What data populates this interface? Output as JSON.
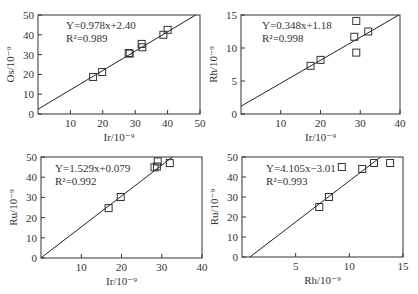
{
  "chart_data": [
    {
      "type": "scatter",
      "panel": "top-left",
      "xlabel": "Ir/10⁻⁹",
      "ylabel": "Os/10⁻⁹",
      "xlim": [
        0,
        50
      ],
      "ylim": [
        0,
        50
      ],
      "xticks": [
        10,
        20,
        30,
        40,
        50
      ],
      "yticks": [
        0,
        10,
        20,
        30,
        40,
        50
      ],
      "equation": "Y=0.978x+2.40",
      "r2": "R²=0.989",
      "fit": {
        "slope": 0.978,
        "intercept": 2.4
      },
      "points": [
        {
          "x": 17.0,
          "y": 18.7
        },
        {
          "x": 19.8,
          "y": 21.2
        },
        {
          "x": 28.0,
          "y": 30.8
        },
        {
          "x": 28.3,
          "y": 30.5
        },
        {
          "x": 32.0,
          "y": 35.4
        },
        {
          "x": 32.2,
          "y": 33.7
        },
        {
          "x": 38.7,
          "y": 40.0
        },
        {
          "x": 40.0,
          "y": 42.5
        }
      ],
      "grid": false
    },
    {
      "type": "scatter",
      "panel": "top-right",
      "xlabel": "Ir/10⁻⁹",
      "ylabel": "Rh/10⁻⁹",
      "xlim": [
        0,
        40
      ],
      "ylim": [
        0,
        15
      ],
      "xticks": [
        10,
        20,
        30,
        40
      ],
      "yticks": [
        0,
        5,
        10,
        15
      ],
      "equation": "Y=0.348x+1.18",
      "r2": "R²=0.998",
      "fit": {
        "slope": 0.348,
        "intercept": 1.18
      },
      "points": [
        {
          "x": 17.5,
          "y": 7.3
        },
        {
          "x": 20.0,
          "y": 8.2
        },
        {
          "x": 28.5,
          "y": 11.7
        },
        {
          "x": 29.0,
          "y": 14.1
        },
        {
          "x": 29.0,
          "y": 9.3
        },
        {
          "x": 32.0,
          "y": 12.5
        }
      ],
      "grid": false
    },
    {
      "type": "scatter",
      "panel": "bottom-left",
      "xlabel": "Ir/10⁻⁹",
      "ylabel": "Ru/10⁻⁹",
      "xlim": [
        0,
        40
      ],
      "ylim": [
        0,
        50
      ],
      "xticks": [
        10,
        20,
        30,
        40
      ],
      "yticks": [
        0,
        10,
        20,
        30,
        40,
        50
      ],
      "equation": "Y=1.529x+0.079",
      "r2": "R²=0.992",
      "fit": {
        "slope": 1.529,
        "intercept": 0.079
      },
      "points": [
        {
          "x": 16.8,
          "y": 24.7
        },
        {
          "x": 19.8,
          "y": 30.2
        },
        {
          "x": 28.2,
          "y": 44.9
        },
        {
          "x": 28.8,
          "y": 45.3
        },
        {
          "x": 29.0,
          "y": 47.8
        },
        {
          "x": 32.0,
          "y": 47.0
        }
      ],
      "grid": false
    },
    {
      "type": "scatter",
      "panel": "bottom-right",
      "xlabel": "Rh/10⁻⁹",
      "ylabel": "Ru/10⁻⁹",
      "xlim": [
        0,
        15
      ],
      "ylim": [
        0,
        50
      ],
      "xticks": [
        5,
        10,
        15
      ],
      "yticks": [
        0,
        10,
        20,
        30,
        40,
        50
      ],
      "equation": "Y=4.105x−3.01",
      "r2": "R²=0.993",
      "fit": {
        "slope": 4.105,
        "intercept": -3.01
      },
      "points": [
        {
          "x": 7.2,
          "y": 25.0
        },
        {
          "x": 8.1,
          "y": 30.0
        },
        {
          "x": 9.3,
          "y": 45.0
        },
        {
          "x": 11.2,
          "y": 44.0
        },
        {
          "x": 12.3,
          "y": 47.0
        },
        {
          "x": 13.8,
          "y": 47.0
        }
      ],
      "grid": false
    }
  ]
}
